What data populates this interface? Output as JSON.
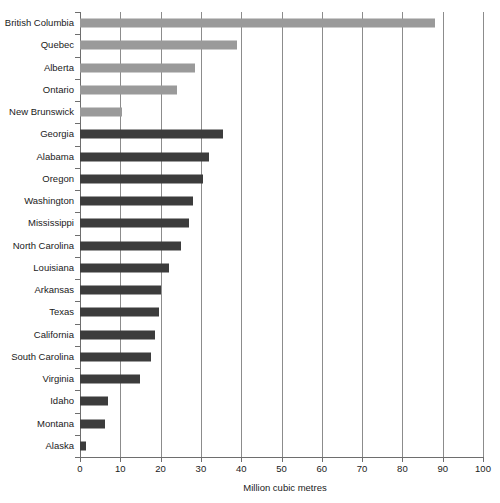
{
  "chart_data": {
    "type": "bar",
    "orientation": "horizontal",
    "title": "",
    "subtitle": "",
    "xlabel": "Million cubic metres",
    "ylabel": "",
    "xlim": [
      0,
      100
    ],
    "ylim": null,
    "grid": true,
    "legend": null,
    "xticks": [
      0,
      10,
      20,
      30,
      40,
      50,
      60,
      70,
      80,
      90,
      100
    ],
    "xtick_labels": [
      "0",
      "10",
      "20",
      "30",
      "40",
      "50",
      "60",
      "70",
      "80",
      "90",
      "100"
    ],
    "categories": [
      "British Columbia",
      "Quebec",
      "Alberta",
      "Ontario",
      "New Brunswick",
      "Georgia",
      "Alabama",
      "Oregon",
      "Washington",
      "Mississippi",
      "North Carolina",
      "Louisiana",
      "Arkansas",
      "Texas",
      "California",
      "South Carolina",
      "Virginia",
      "Idaho",
      "Montana",
      "Alaska"
    ],
    "values": [
      88,
      39,
      28.5,
      24,
      10.5,
      35.5,
      32,
      30.5,
      28,
      27,
      25,
      22,
      20,
      19.5,
      18.5,
      17.5,
      15,
      7,
      6.2,
      1.5
    ],
    "bar_colors": [
      "#9a9a9a",
      "#9a9a9a",
      "#9a9a9a",
      "#9a9a9a",
      "#9a9a9a",
      "#3c3c3c",
      "#3c3c3c",
      "#3c3c3c",
      "#3c3c3c",
      "#3c3c3c",
      "#3c3c3c",
      "#3c3c3c",
      "#3c3c3c",
      "#3c3c3c",
      "#3c3c3c",
      "#3c3c3c",
      "#3c3c3c",
      "#3c3c3c",
      "#3c3c3c",
      "#3c3c3c"
    ],
    "series": [
      {
        "name": "Million cubic metres",
        "values": [
          88,
          39,
          28.5,
          24,
          10.5,
          35.5,
          32,
          30.5,
          28,
          27,
          25,
          22,
          20,
          19.5,
          18.5,
          17.5,
          15,
          7,
          6.2,
          1.5
        ]
      }
    ],
    "colors": {
      "canadian_provinces": "#9a9a9a",
      "us_states": "#3c3c3c",
      "axis": "#6e6e6e",
      "gridline": "#8c8c8c",
      "background": "#ffffff",
      "text": "#1a1a1a"
    }
  }
}
